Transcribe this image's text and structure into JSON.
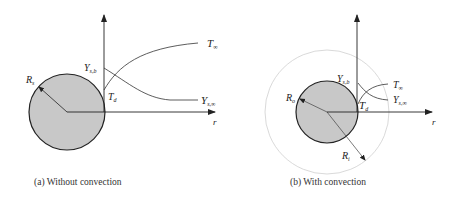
{
  "colors": {
    "droplet_fill": "#c8c8c8",
    "droplet_stroke": "#222222",
    "axis": "#222222",
    "boundary": "#cfcfcf"
  },
  "panel_a": {
    "caption": "(a) Without convection",
    "labels": {
      "radius_main": "R",
      "radius_sub": "s",
      "y_surface_main": "Y",
      "y_surface_sub": "s,b",
      "t_surface_main": "T",
      "t_surface_sub": "d",
      "t_inf_main": "T",
      "t_inf_sub": "∞",
      "y_inf_main": "Y",
      "y_inf_sub": "s,∞",
      "r_axis": "r"
    }
  },
  "panel_b": {
    "caption": "(b) With convection",
    "labels": {
      "radius_outer_main": "R",
      "radius_outer_sub": "o",
      "radius_inner_main": "R",
      "radius_inner_sub": "i",
      "y_surface_main": "Y",
      "y_surface_sub": "s,b",
      "t_surface_main": "T",
      "t_surface_sub": "d",
      "t_inf_main": "T",
      "t_inf_sub": "∞",
      "y_inf_main": "Y",
      "y_inf_sub": "s,∞",
      "r_axis": "r"
    }
  }
}
